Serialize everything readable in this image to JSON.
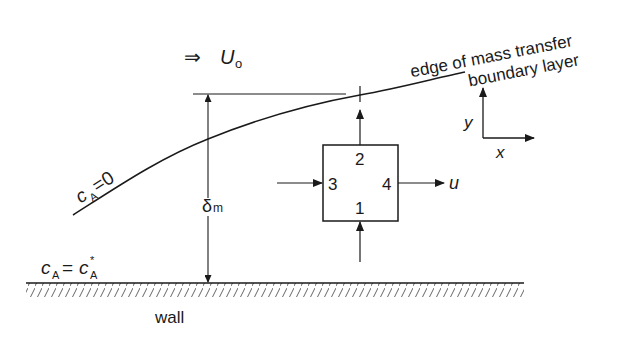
{
  "diagram": {
    "free_stream": {
      "arrow_glyph": "⇒",
      "symbol": "U",
      "subscript": "o"
    },
    "boundary_layer_label": {
      "line1": "edge of mass transfer",
      "line2": "boundary layer"
    },
    "edge_condition": {
      "symbol": "c",
      "subscript": "A",
      "rest": "=0"
    },
    "wall_condition": {
      "symbol": "c",
      "subscript": "A",
      "eq": "=",
      "rhs": "c",
      "rhs_sup": "*",
      "rhs_sub": "A"
    },
    "thickness": {
      "symbol": "δ",
      "subscript": "m"
    },
    "control_volume": {
      "faces": [
        {
          "id": "1",
          "label": "1",
          "position": "bottom"
        },
        {
          "id": "2",
          "label": "2",
          "position": "top"
        },
        {
          "id": "3",
          "label": "3",
          "position": "left"
        },
        {
          "id": "4",
          "label": "4",
          "position": "right"
        }
      ],
      "velocity_label": "u"
    },
    "axes": {
      "x": "x",
      "y": "y"
    },
    "wall_label": "wall",
    "colors": {
      "ink": "#1a1a1a",
      "background": "#ffffff"
    }
  }
}
